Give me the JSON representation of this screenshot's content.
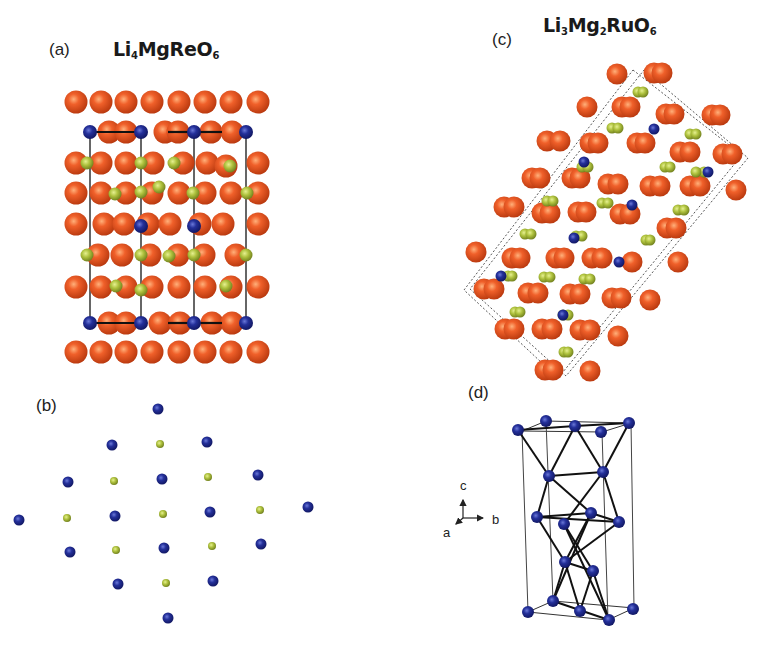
{
  "figure": {
    "panels": {
      "a": {
        "label": "(a)",
        "formula": {
          "parts": [
            {
              "t": "Li"
            },
            {
              "s": "4"
            },
            {
              "t": "MgReO"
            },
            {
              "s": "6"
            }
          ]
        },
        "formula_text": "Li4MgReO6"
      },
      "b": {
        "label": "(b)"
      },
      "c": {
        "label": "(c)",
        "formula": {
          "parts": [
            {
              "t": "Li"
            },
            {
              "s": "3"
            },
            {
              "t": "Mg"
            },
            {
              "s": "2"
            },
            {
              "t": "RuO"
            },
            {
              "s": "6"
            }
          ]
        },
        "formula_text": "Li3Mg2RuO6"
      },
      "d": {
        "label": "(d)",
        "axes": {
          "c": "c",
          "b": "b",
          "a": "a"
        }
      }
    },
    "colors": {
      "oxygen": "#e8541e",
      "oxygen_dark": "#b83a10",
      "metal_blue": "#1f2a8a",
      "lithium_green": "#a9be3c",
      "cell_line": "#222222",
      "bond_line": "#111111"
    },
    "atoms_a": {
      "o_rows_full": [
        102,
        193,
        287,
        352
      ],
      "o_cols_full": [
        76,
        101,
        126,
        152,
        179,
        205,
        231,
        258
      ],
      "o_rows_partial": [
        132,
        163,
        224,
        255,
        323
      ],
      "cell_x": [
        90,
        141,
        194,
        246
      ],
      "cell_y": [
        132,
        323
      ],
      "blue": [
        [
          90,
          132
        ],
        [
          141,
          132
        ],
        [
          194,
          132
        ],
        [
          246,
          132
        ],
        [
          90,
          323
        ],
        [
          141,
          323
        ],
        [
          194,
          323
        ],
        [
          246,
          323
        ],
        [
          141,
          226
        ],
        [
          194,
          226
        ]
      ],
      "green": [
        [
          87,
          163
        ],
        [
          141,
          163
        ],
        [
          174,
          163
        ],
        [
          230,
          166
        ],
        [
          115,
          194
        ],
        [
          141,
          192
        ],
        [
          159,
          187
        ],
        [
          193,
          193
        ],
        [
          247,
          193
        ],
        [
          87,
          255
        ],
        [
          141,
          255
        ],
        [
          169,
          256
        ],
        [
          194,
          255
        ],
        [
          246,
          255
        ],
        [
          116,
          286
        ],
        [
          141,
          290
        ],
        [
          226,
          286
        ]
      ],
      "o_partial": [
        [
          109,
          132
        ],
        [
          126,
          132
        ],
        [
          165,
          132
        ],
        [
          178,
          132
        ],
        [
          211,
          132
        ],
        [
          232,
          132
        ],
        [
          76,
          163
        ],
        [
          101,
          163
        ],
        [
          126,
          163
        ],
        [
          153,
          163
        ],
        [
          183,
          163
        ],
        [
          207,
          163
        ],
        [
          226,
          166
        ],
        [
          258,
          163
        ],
        [
          76,
          224
        ],
        [
          104,
          224
        ],
        [
          124,
          224
        ],
        [
          148,
          224
        ],
        [
          170,
          224
        ],
        [
          200,
          224
        ],
        [
          223,
          224
        ],
        [
          258,
          224
        ],
        [
          98,
          255
        ],
        [
          122,
          255
        ],
        [
          150,
          255
        ],
        [
          178,
          255
        ],
        [
          204,
          255
        ],
        [
          236,
          255
        ],
        [
          109,
          323
        ],
        [
          126,
          323
        ],
        [
          160,
          323
        ],
        [
          180,
          323
        ],
        [
          212,
          323
        ],
        [
          232,
          323
        ]
      ]
    },
    "atoms_b": {
      "blue": [
        [
          158,
          409
        ],
        [
          112,
          445
        ],
        [
          207,
          442
        ],
        [
          68,
          482
        ],
        [
          162,
          479
        ],
        [
          258,
          475
        ],
        [
          19,
          520
        ],
        [
          115,
          516
        ],
        [
          210,
          512
        ],
        [
          308,
          507
        ],
        [
          70,
          552
        ],
        [
          164,
          548
        ],
        [
          261,
          544
        ],
        [
          118,
          584
        ],
        [
          213,
          581
        ],
        [
          168,
          618
        ]
      ],
      "green": [
        [
          160,
          444
        ],
        [
          114,
          481
        ],
        [
          208,
          477
        ],
        [
          67,
          518
        ],
        [
          163,
          514
        ],
        [
          260,
          510
        ],
        [
          116,
          550
        ],
        [
          212,
          546
        ],
        [
          166,
          583
        ]
      ]
    },
    "atoms_c": {
      "orange": [
        [
          617,
          74
        ],
        [
          654,
          73
        ],
        [
          662,
          73
        ],
        [
          587,
          107
        ],
        [
          622,
          107
        ],
        [
          630,
          107
        ],
        [
          666,
          114
        ],
        [
          674,
          114
        ],
        [
          712,
          115
        ],
        [
          720,
          115
        ],
        [
          547,
          141
        ],
        [
          560,
          141
        ],
        [
          590,
          143
        ],
        [
          598,
          143
        ],
        [
          637,
          143
        ],
        [
          645,
          143
        ],
        [
          680,
          152
        ],
        [
          690,
          152
        ],
        [
          723,
          154
        ],
        [
          732,
          154
        ],
        [
          532,
          178
        ],
        [
          540,
          178
        ],
        [
          572,
          178
        ],
        [
          580,
          178
        ],
        [
          608,
          184
        ],
        [
          618,
          184
        ],
        [
          650,
          186
        ],
        [
          660,
          186
        ],
        [
          690,
          186
        ],
        [
          700,
          186
        ],
        [
          736,
          190
        ],
        [
          504,
          207
        ],
        [
          514,
          207
        ],
        [
          542,
          213
        ],
        [
          550,
          213
        ],
        [
          578,
          212
        ],
        [
          586,
          212
        ],
        [
          620,
          214
        ],
        [
          630,
          214
        ],
        [
          667,
          228
        ],
        [
          676,
          228
        ],
        [
          476,
          252
        ],
        [
          512,
          258
        ],
        [
          520,
          258
        ],
        [
          556,
          258
        ],
        [
          564,
          258
        ],
        [
          592,
          258
        ],
        [
          602,
          258
        ],
        [
          632,
          262
        ],
        [
          678,
          262
        ],
        [
          484,
          289
        ],
        [
          494,
          289
        ],
        [
          528,
          293
        ],
        [
          538,
          293
        ],
        [
          570,
          294
        ],
        [
          580,
          294
        ],
        [
          612,
          298
        ],
        [
          621,
          298
        ],
        [
          650,
          300
        ],
        [
          505,
          329
        ],
        [
          514,
          329
        ],
        [
          542,
          329
        ],
        [
          552,
          329
        ],
        [
          580,
          330
        ],
        [
          590,
          330
        ],
        [
          618,
          336
        ],
        [
          545,
          370
        ],
        [
          553,
          370
        ],
        [
          590,
          371
        ]
      ],
      "green": [
        [
          638,
          92
        ],
        [
          643,
          92
        ],
        [
          612,
          128
        ],
        [
          618,
          128
        ],
        [
          690,
          134
        ],
        [
          696,
          134
        ],
        [
          582,
          167
        ],
        [
          588,
          167
        ],
        [
          665,
          167
        ],
        [
          670,
          167
        ],
        [
          704,
          172
        ],
        [
          696,
          172
        ],
        [
          547,
          201
        ],
        [
          553,
          201
        ],
        [
          602,
          203
        ],
        [
          608,
          203
        ],
        [
          678,
          210
        ],
        [
          684,
          210
        ],
        [
          525,
          234
        ],
        [
          531,
          234
        ],
        [
          576,
          236
        ],
        [
          582,
          236
        ],
        [
          646,
          240
        ],
        [
          650,
          240
        ],
        [
          508,
          276
        ],
        [
          512,
          276
        ],
        [
          544,
          277
        ],
        [
          550,
          277
        ],
        [
          584,
          279
        ],
        [
          590,
          279
        ],
        [
          515,
          312
        ],
        [
          520,
          312
        ],
        [
          563,
          315
        ],
        [
          568,
          315
        ],
        [
          564,
          352
        ],
        [
          568,
          352
        ]
      ],
      "blue": [
        [
          654,
          129
        ],
        [
          584,
          162
        ],
        [
          708,
          172
        ],
        [
          632,
          205
        ],
        [
          574,
          238
        ],
        [
          501,
          276
        ],
        [
          619,
          262
        ],
        [
          563,
          315
        ]
      ],
      "cell_outer": [
        [
          633,
          70
        ],
        [
          742,
          155
        ],
        [
          558,
          378
        ],
        [
          464,
          290
        ]
      ],
      "cell_inner": [
        [
          644,
          70
        ],
        [
          748,
          158
        ],
        [
          566,
          376
        ],
        [
          470,
          289
        ]
      ]
    },
    "atoms_d": {
      "blue": [
        [
          518,
          430
        ],
        [
          546,
          421
        ],
        [
          575,
          426
        ],
        [
          601,
          432
        ],
        [
          629,
          423
        ],
        [
          549,
          476
        ],
        [
          603,
          472
        ],
        [
          537,
          517
        ],
        [
          591,
          513
        ],
        [
          564,
          524
        ],
        [
          619,
          522
        ],
        [
          565,
          562
        ],
        [
          593,
          571
        ],
        [
          553,
          601
        ],
        [
          580,
          611
        ],
        [
          609,
          620
        ],
        [
          528,
          612
        ],
        [
          633,
          609
        ]
      ],
      "box": {
        "top": [
          [
            522,
            431
          ],
          [
            546,
            421
          ],
          [
            631,
            423
          ],
          [
            602,
            432
          ]
        ],
        "bottom": [
          [
            528,
            612
          ],
          [
            553,
            601
          ],
          [
            634,
            608
          ],
          [
            608,
            620
          ]
        ]
      },
      "bonds": [
        [
          518,
          430,
          575,
          426
        ],
        [
          575,
          426,
          629,
          423
        ],
        [
          518,
          430,
          549,
          476
        ],
        [
          575,
          426,
          549,
          476
        ],
        [
          575,
          426,
          603,
          472
        ],
        [
          629,
          423,
          603,
          472
        ],
        [
          549,
          476,
          603,
          472
        ],
        [
          549,
          476,
          537,
          517
        ],
        [
          603,
          472,
          619,
          522
        ],
        [
          549,
          476,
          591,
          513
        ],
        [
          537,
          517,
          619,
          522
        ],
        [
          537,
          517,
          591,
          513
        ],
        [
          591,
          513,
          619,
          522
        ],
        [
          537,
          517,
          565,
          562
        ],
        [
          564,
          524,
          593,
          571
        ],
        [
          619,
          522,
          565,
          562
        ],
        [
          591,
          513,
          565,
          562
        ],
        [
          565,
          562,
          593,
          571
        ],
        [
          565,
          562,
          553,
          601
        ],
        [
          565,
          562,
          580,
          611
        ],
        [
          593,
          571,
          580,
          611
        ],
        [
          593,
          571,
          609,
          620
        ],
        [
          553,
          601,
          609,
          620
        ],
        [
          603,
          472,
          564,
          524
        ],
        [
          591,
          513,
          553,
          601
        ],
        [
          564,
          524,
          609,
          620
        ]
      ]
    }
  }
}
